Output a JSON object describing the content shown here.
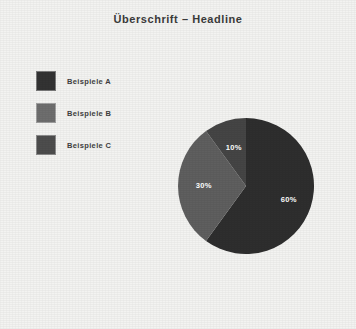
{
  "page": {
    "background_color": "#f3f3f1"
  },
  "header": {
    "title": "Überschrift – Headline",
    "title_color": "#3b3b3b"
  },
  "legend": {
    "position": "left",
    "items": [
      {
        "label": "Beispiele A",
        "color": "#333333"
      },
      {
        "label": "Beispiele B",
        "color": "#6e6e6e"
      },
      {
        "label": "Beispiele C",
        "color": "#4d4d4d"
      }
    ]
  },
  "chart_data": {
    "type": "pie",
    "title": "Überschrift – Headline",
    "xlabel": "",
    "ylabel": "",
    "categories": [
      "Beispiele A",
      "Beispiele B",
      "Beispiele C"
    ],
    "values": [
      60,
      30,
      10
    ],
    "labels": [
      "60%",
      "30%",
      "10%"
    ],
    "colors": [
      "#2e2e2e",
      "#5f5f5f",
      "#454545"
    ],
    "start_angle_deg": 0,
    "direction": "clockwise",
    "grid": false,
    "legend_position": "left",
    "center": {
      "x": 68,
      "y": 68
    },
    "radius": 68,
    "label_radius_factor": [
      0.66,
      0.62,
      0.58
    ]
  }
}
